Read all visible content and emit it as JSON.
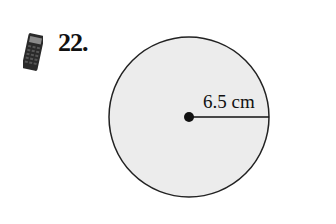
{
  "problem": {
    "number": "22.",
    "icon": "calculator-icon"
  },
  "figure": {
    "shape": "circle",
    "radius_label": "6.5 cm",
    "fill_color": "#ececec",
    "stroke_color": "#222222"
  }
}
